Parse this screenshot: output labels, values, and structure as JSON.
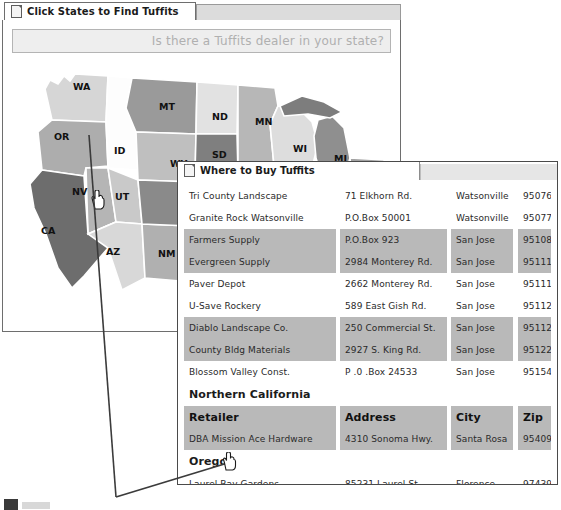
{
  "main_window": {
    "tab_label": "Click States to Find Tuffits",
    "tab_icon": "document-icon",
    "banner_text": "Is there a Tuffits dealer in your state?"
  },
  "map": {
    "name": "united-states-dealer-map",
    "cursor_icon": "hand-pointer-cursor",
    "cursor_over_state": "OR",
    "states": [
      {
        "code": "WA",
        "x": 61,
        "y": 28,
        "fill": "#d6d6d6"
      },
      {
        "code": "OR",
        "x": 42,
        "y": 78,
        "fill": "#adadad"
      },
      {
        "code": "ID",
        "x": 102,
        "y": 92,
        "fill": "#fdfdfd"
      },
      {
        "code": "MT",
        "x": 147,
        "y": 48,
        "fill": "#9a9a9a"
      },
      {
        "code": "WY",
        "x": 158,
        "y": 105,
        "fill": "#bfbfbf"
      },
      {
        "code": "NV",
        "x": 60,
        "y": 133,
        "fill": "#b5b5b5"
      },
      {
        "code": "UT",
        "x": 103,
        "y": 138,
        "fill": "#c9c9c9"
      },
      {
        "code": "CA",
        "x": 29,
        "y": 172,
        "fill": "#6d6d6d"
      },
      {
        "code": "AZ",
        "x": 94,
        "y": 193,
        "fill": "#d8d8d8"
      },
      {
        "code": "NM",
        "x": 146,
        "y": 195,
        "fill": "#b0b0b0"
      },
      {
        "code": "ND",
        "x": 200,
        "y": 58,
        "fill": "#e2e2e2"
      },
      {
        "code": "SD",
        "x": 200,
        "y": 96,
        "fill": "#7f7f7f"
      },
      {
        "code": "NE",
        "x": 204,
        "y": 128,
        "fill": "#8c8c8c"
      },
      {
        "code": "MN",
        "x": 243,
        "y": 63,
        "fill": "#b7b7b7"
      },
      {
        "code": "IA",
        "x": 249,
        "y": 119,
        "fill": "#fcfcfc"
      },
      {
        "code": "WI",
        "x": 281,
        "y": 90,
        "fill": "#dddddd"
      },
      {
        "code": "MI",
        "x": 322,
        "y": 100,
        "fill": "#8f8f8f"
      },
      {
        "code": "OH",
        "x": 343,
        "y": 128,
        "fill": "#757575"
      }
    ]
  },
  "dealer_window": {
    "title_label": "Where to Buy Tuffits",
    "title_icon": "document-icon",
    "columns": {
      "retailer": "Retailer",
      "address": "Address",
      "city": "City",
      "zip": "Zip"
    },
    "rows": [
      {
        "kind": "data",
        "band": false,
        "retailer": "Tri County Landscape",
        "address": "71 Elkhorn Rd.",
        "city": "Watsonville",
        "zip": "95076"
      },
      {
        "kind": "data",
        "band": false,
        "retailer": "Granite Rock Watsonville",
        "address": "P.O.Box 50001",
        "city": "Watsonville",
        "zip": "95077"
      },
      {
        "kind": "data",
        "band": true,
        "retailer": "Farmers Supply",
        "address": "P.O.Box 923",
        "city": "San Jose",
        "zip": "95108"
      },
      {
        "kind": "data",
        "band": true,
        "retailer": "Evergreen Supply",
        "address": "2984 Monterey Rd.",
        "city": "San Jose",
        "zip": "95111"
      },
      {
        "kind": "data",
        "band": false,
        "retailer": "Paver Depot",
        "address": "2662 Monterey Rd.",
        "city": "San Jose",
        "zip": "95111"
      },
      {
        "kind": "data",
        "band": false,
        "retailer": "U-Save Rockery",
        "address": "589 East Gish Rd.",
        "city": "San Jose",
        "zip": "95112"
      },
      {
        "kind": "data",
        "band": true,
        "retailer": "Diablo Landscape Co.",
        "address": "250 Commercial St.",
        "city": "San Jose",
        "zip": "95112"
      },
      {
        "kind": "data",
        "band": true,
        "retailer": "County Bldg Materials",
        "address": "2927 S. King Rd.",
        "city": "San Jose",
        "zip": "95122"
      },
      {
        "kind": "data",
        "band": false,
        "retailer": "Blossom Valley Const.",
        "address": "P .0 .Box 24533",
        "city": "San Jose",
        "zip": "95154"
      },
      {
        "kind": "section",
        "band": false,
        "retailer": "Northern California",
        "address": "",
        "city": "",
        "zip": ""
      },
      {
        "kind": "colhead",
        "band": true,
        "retailer": "Retailer",
        "address": "Address",
        "city": "City",
        "zip": "Zip"
      },
      {
        "kind": "data",
        "band": true,
        "retailer": "DBA Mission Ace Hardware",
        "address": "4310 Sonoma Hwy.",
        "city": "Santa Rosa",
        "zip": "95409"
      },
      {
        "kind": "section",
        "band": false,
        "retailer": "Oregon",
        "address": "",
        "city": "",
        "zip": ""
      },
      {
        "kind": "data",
        "band": false,
        "retailer": "Laurel Bay Gardens",
        "address": "85231 Laurel St.",
        "city": "Florence",
        "zip": "97439"
      }
    ]
  },
  "annotations": {
    "leader_line_map": "callout-line-from-oregon-state",
    "leader_line_table": "callout-line-from-oregon-row",
    "cursor_icon": "hand-pointer-cursor"
  },
  "taskbar": {
    "icon": "start-button-icon"
  },
  "colors": {
    "band": "#b9b9b9",
    "window_border": "#4a4a4a",
    "banner_bg": "#eeeeee",
    "banner_text": "#b0b0b0"
  }
}
